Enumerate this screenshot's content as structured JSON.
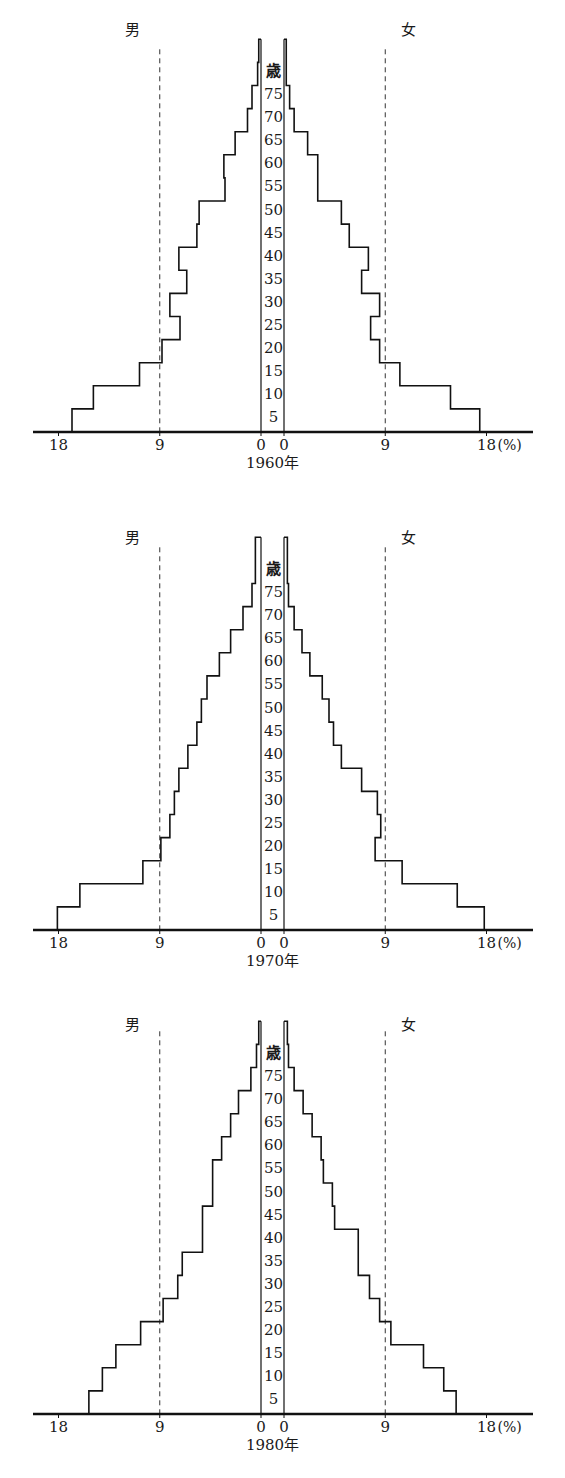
{
  "chart_data": [
    {
      "type": "bar",
      "subtype": "population-pyramid",
      "title": "1960年",
      "left_label": "男",
      "right_label": "女",
      "age_axis_title": "歳",
      "age_tick_labels": [
        "5",
        "10",
        "15",
        "20",
        "25",
        "30",
        "35",
        "40",
        "45",
        "50",
        "55",
        "60",
        "65",
        "70",
        "75"
      ],
      "x_tick_labels_left": [
        "18",
        "9",
        "0"
      ],
      "x_tick_labels_right": [
        "0",
        "9",
        "18"
      ],
      "x_unit": "(%)",
      "xlim": [
        0,
        18
      ],
      "reference_lines": [
        9
      ],
      "categories": [
        "0-4",
        "5-9",
        "10-14",
        "15-19",
        "20-24",
        "25-29",
        "30-34",
        "35-39",
        "40-44",
        "45-49",
        "50-54",
        "55-59",
        "60-64",
        "65-69",
        "70-74",
        "75-79",
        "80+"
      ],
      "series": [
        {
          "name": "男",
          "values": [
            16.8,
            14.9,
            10.8,
            8.8,
            7.2,
            8.1,
            6.6,
            7.3,
            5.7,
            5.5,
            3.2,
            3.3,
            2.3,
            1.2,
            0.8,
            0.3,
            0.2
          ]
        },
        {
          "name": "女",
          "values": [
            17.4,
            14.8,
            10.3,
            8.5,
            7.7,
            8.5,
            6.9,
            7.5,
            5.8,
            5.1,
            3.0,
            3.0,
            2.1,
            0.9,
            0.5,
            0.2,
            0.2
          ]
        }
      ]
    },
    {
      "type": "bar",
      "subtype": "population-pyramid",
      "title": "1970年",
      "left_label": "男",
      "right_label": "女",
      "age_axis_title": "歳",
      "age_tick_labels": [
        "5",
        "10",
        "15",
        "20",
        "25",
        "30",
        "35",
        "40",
        "45",
        "50",
        "55",
        "60",
        "65",
        "70",
        "75"
      ],
      "x_tick_labels_left": [
        "18",
        "9",
        "0"
      ],
      "x_tick_labels_right": [
        "0",
        "9",
        "18"
      ],
      "x_unit": "(%)",
      "xlim": [
        0,
        18
      ],
      "reference_lines": [
        9
      ],
      "categories": [
        "0-4",
        "5-9",
        "10-14",
        "15-19",
        "20-24",
        "25-29",
        "30-34",
        "35-39",
        "40-44",
        "45-49",
        "50-54",
        "55-59",
        "60-64",
        "65-69",
        "70-74",
        "75-79",
        "80+"
      ],
      "series": [
        {
          "name": "男",
          "values": [
            18.1,
            16.1,
            10.5,
            8.9,
            8.1,
            7.7,
            7.3,
            6.5,
            5.7,
            5.3,
            4.8,
            3.7,
            2.7,
            1.6,
            0.8,
            0.5,
            0.5
          ]
        },
        {
          "name": "女",
          "values": [
            17.8,
            15.4,
            10.5,
            8.1,
            8.6,
            8.3,
            6.9,
            5.1,
            4.4,
            4.0,
            3.4,
            2.3,
            1.6,
            0.9,
            0.4,
            0.3,
            0.3
          ]
        }
      ]
    },
    {
      "type": "bar",
      "subtype": "population-pyramid",
      "title": "1980年",
      "left_label": "男",
      "right_label": "女",
      "age_axis_title": "歳",
      "age_tick_labels": [
        "5",
        "10",
        "15",
        "20",
        "25",
        "30",
        "35",
        "40",
        "45",
        "50",
        "55",
        "60",
        "65",
        "70",
        "75"
      ],
      "x_tick_labels_left": [
        "18",
        "9",
        "0"
      ],
      "x_tick_labels_right": [
        "0",
        "9",
        "18"
      ],
      "x_unit": "(%)",
      "xlim": [
        0,
        18
      ],
      "reference_lines": [
        9
      ],
      "categories": [
        "0-4",
        "5-9",
        "10-14",
        "15-19",
        "20-24",
        "25-29",
        "30-34",
        "35-39",
        "40-44",
        "45-49",
        "50-54",
        "55-59",
        "60-64",
        "65-69",
        "70-74",
        "75-79",
        "80+"
      ],
      "series": [
        {
          "name": "男",
          "values": [
            15.3,
            14.1,
            12.9,
            10.7,
            8.7,
            7.4,
            7.0,
            5.2,
            5.2,
            4.3,
            4.3,
            3.5,
            2.7,
            2.0,
            0.9,
            0.4,
            0.2
          ]
        },
        {
          "name": "女",
          "values": [
            15.3,
            14.2,
            12.4,
            9.5,
            8.5,
            7.6,
            6.6,
            6.6,
            4.5,
            4.3,
            3.5,
            3.3,
            2.5,
            1.7,
            0.9,
            0.4,
            0.3
          ]
        }
      ]
    }
  ]
}
